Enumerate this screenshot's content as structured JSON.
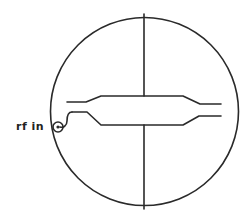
{
  "diagram": {
    "type": "waveguide-coupler-schematic",
    "labels": {
      "input_port": "rf in"
    },
    "colors": {
      "stroke": "#2a2a2a",
      "background": "#ffffff"
    },
    "elements": [
      "circular-housing",
      "vertical-crosshair-line",
      "upper-transmission-line",
      "lower-transmission-line",
      "rf-input-port"
    ]
  }
}
